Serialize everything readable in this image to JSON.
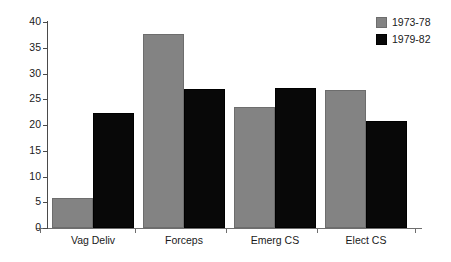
{
  "chart_data": {
    "type": "bar",
    "title": "",
    "subtitle": "",
    "xlabel": "",
    "ylabel": "",
    "categories": [
      "Vag Deliv",
      "Forceps",
      "Emerg CS",
      "Elect CS"
    ],
    "series": [
      {
        "name": "1973-78",
        "color": "#838383",
        "values": [
          5.9,
          37.6,
          23.5,
          26.8
        ]
      },
      {
        "name": "1979-82",
        "color": "#080808",
        "values": [
          22.4,
          27.0,
          27.2,
          20.7
        ]
      }
    ],
    "ylim": [
      0,
      40
    ],
    "ytick_values": [
      0,
      5,
      10,
      15,
      20,
      25,
      30,
      35,
      40
    ],
    "ytick_labels": [
      "0",
      "5",
      "10",
      "15",
      "20",
      "25",
      "30",
      "35",
      "40"
    ],
    "grid": false,
    "legend_position": "top-right",
    "annotations": []
  },
  "legend": {
    "items": [
      {
        "label": "1973-78",
        "swatch": "gray-square-swatch"
      },
      {
        "label": "1979-82",
        "swatch": "black-square-swatch"
      }
    ]
  },
  "colors": {
    "series_1973_78": "#838383",
    "series_1979_82": "#080808",
    "axis": "#4a4a4a",
    "text": "#1a1a1a",
    "background": "#ffffff"
  }
}
